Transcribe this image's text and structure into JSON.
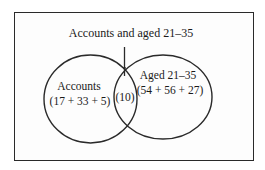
{
  "diagram": {
    "type": "venn",
    "title": "Accounts and aged 21–35",
    "sets": [
      {
        "name": "Accounts",
        "label": "Accounts",
        "values_text": "(17 + 33 + 5)",
        "components": [
          17,
          33,
          5
        ]
      },
      {
        "name": "Aged 21-35",
        "label": "Aged 21–35",
        "values_text": "(54 + 56 + 27)",
        "components": [
          54,
          56,
          27
        ]
      }
    ],
    "intersection": {
      "label_text": "(10)",
      "value": 10,
      "pointer_label": "Accounts and aged 21–35"
    },
    "colors": {
      "stroke": "#2a2a2a",
      "background": "#ffffff",
      "text": "#1a1a1a"
    }
  }
}
